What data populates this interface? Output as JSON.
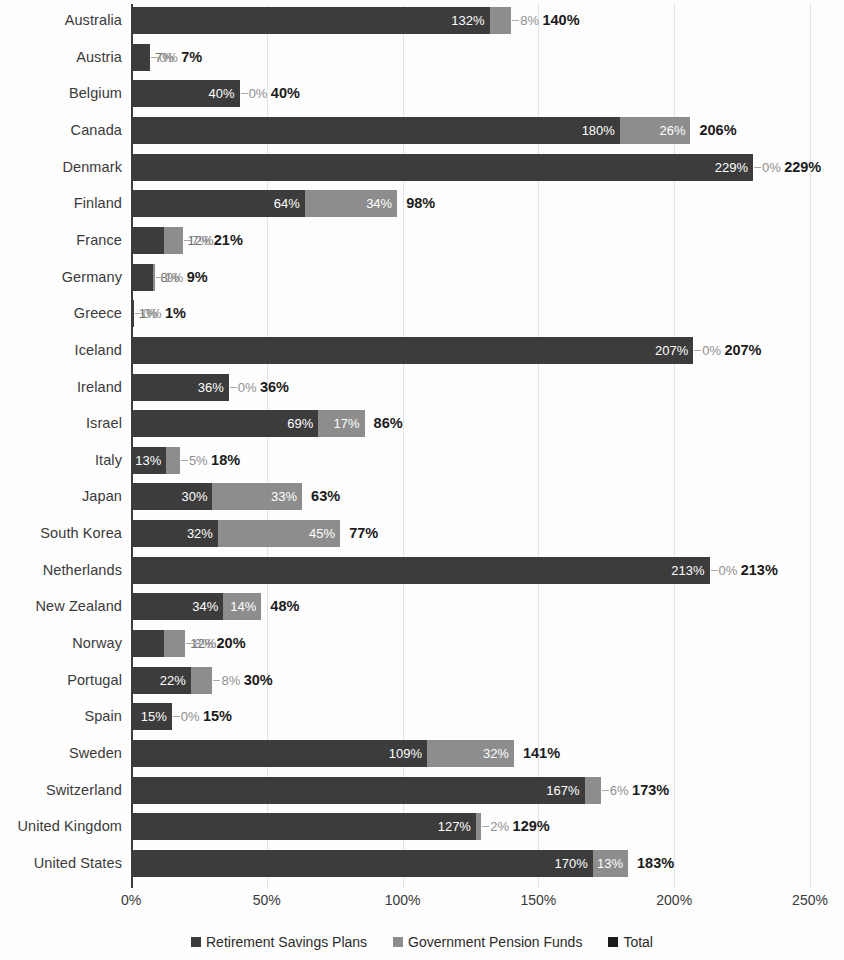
{
  "chart_data": {
    "type": "bar",
    "subtype": "stacked-horizontal",
    "title": "",
    "xlabel": "",
    "ylabel": "",
    "xlim": [
      0,
      250
    ],
    "xticks": [
      0,
      50,
      100,
      150,
      200,
      250
    ],
    "xtick_labels": [
      "0%",
      "50%",
      "100%",
      "150%",
      "200%",
      "250%"
    ],
    "grid": true,
    "grid_axis": "x",
    "legend_position": "bottom",
    "categories": [
      "Australia",
      "Austria",
      "Belgium",
      "Canada",
      "Denmark",
      "Finland",
      "France",
      "Germany",
      "Greece",
      "Iceland",
      "Ireland",
      "Israel",
      "Italy",
      "Japan",
      "South Korea",
      "Netherlands",
      "New Zealand",
      "Norway",
      "Portugal",
      "Spain",
      "Sweden",
      "Switzerland",
      "United Kingdom",
      "United States"
    ],
    "series": [
      {
        "name": "Retirement Savings Plans",
        "color": "#3c3c3c",
        "values": [
          132,
          7,
          40,
          180,
          229,
          64,
          12,
          8,
          1,
          207,
          36,
          69,
          13,
          30,
          32,
          213,
          34,
          12,
          22,
          15,
          109,
          167,
          127,
          170
        ]
      },
      {
        "name": "Government Pension Funds",
        "color": "#8d8d8d",
        "values": [
          8,
          0,
          0,
          26,
          0,
          34,
          7,
          1,
          0,
          0,
          0,
          17,
          5,
          33,
          45,
          0,
          14,
          8,
          8,
          0,
          32,
          6,
          2,
          13
        ]
      }
    ],
    "totals": {
      "name": "Total",
      "color": "#1b1b1b",
      "values": [
        140,
        7,
        40,
        206,
        229,
        98,
        21,
        9,
        1,
        207,
        36,
        86,
        18,
        63,
        77,
        213,
        48,
        20,
        30,
        15,
        141,
        173,
        129,
        183
      ]
    },
    "rows": [
      {
        "country": "Australia",
        "a": 132,
        "b": 8,
        "total": 140,
        "a_label": "132%",
        "b_label": "8%",
        "total_label": "140%"
      },
      {
        "country": "Austria",
        "a": 7,
        "b": 0,
        "total": 7,
        "a_label": "7%",
        "b_label": "0%",
        "total_label": "7%"
      },
      {
        "country": "Belgium",
        "a": 40,
        "b": 0,
        "total": 40,
        "a_label": "40%",
        "b_label": "0%",
        "total_label": "40%"
      },
      {
        "country": "Canada",
        "a": 180,
        "b": 26,
        "total": 206,
        "a_label": "180%",
        "b_label": "26%",
        "total_label": "206%"
      },
      {
        "country": "Denmark",
        "a": 229,
        "b": 0,
        "total": 229,
        "a_label": "229%",
        "b_label": "0%",
        "total_label": "229%"
      },
      {
        "country": "Finland",
        "a": 64,
        "b": 34,
        "total": 98,
        "a_label": "64%",
        "b_label": "34%",
        "total_label": "98%"
      },
      {
        "country": "France",
        "a": 12,
        "b": 7,
        "total": 21,
        "a_label": "12%",
        "b_label": "7%",
        "total_label": "21%"
      },
      {
        "country": "Germany",
        "a": 8,
        "b": 1,
        "total": 9,
        "a_label": "8%",
        "b_label": "1%",
        "total_label": "9%"
      },
      {
        "country": "Greece",
        "a": 1,
        "b": 0,
        "total": 1,
        "a_label": "1%",
        "b_label": "0%",
        "total_label": "1%"
      },
      {
        "country": "Iceland",
        "a": 207,
        "b": 0,
        "total": 207,
        "a_label": "207%",
        "b_label": "0%",
        "total_label": "207%"
      },
      {
        "country": "Ireland",
        "a": 36,
        "b": 0,
        "total": 36,
        "a_label": "36%",
        "b_label": "0%",
        "total_label": "36%"
      },
      {
        "country": "Israel",
        "a": 69,
        "b": 17,
        "total": 86,
        "a_label": "69%",
        "b_label": "17%",
        "total_label": "86%"
      },
      {
        "country": "Italy",
        "a": 13,
        "b": 5,
        "total": 18,
        "a_label": "13%",
        "b_label": "5%",
        "total_label": "18%"
      },
      {
        "country": "Japan",
        "a": 30,
        "b": 33,
        "total": 63,
        "a_label": "30%",
        "b_label": "33%",
        "total_label": "63%"
      },
      {
        "country": "South Korea",
        "a": 32,
        "b": 45,
        "total": 77,
        "a_label": "32%",
        "b_label": "45%",
        "total_label": "77%"
      },
      {
        "country": "Netherlands",
        "a": 213,
        "b": 0,
        "total": 213,
        "a_label": "213%",
        "b_label": "0%",
        "total_label": "213%"
      },
      {
        "country": "New Zealand",
        "a": 34,
        "b": 14,
        "total": 48,
        "a_label": "34%",
        "b_label": "14%",
        "total_label": "48%"
      },
      {
        "country": "Norway",
        "a": 12,
        "b": 8,
        "total": 20,
        "a_label": "12%",
        "b_label": "8%",
        "total_label": "20%"
      },
      {
        "country": "Portugal",
        "a": 22,
        "b": 8,
        "total": 30,
        "a_label": "22%",
        "b_label": "8%",
        "total_label": "30%"
      },
      {
        "country": "Spain",
        "a": 15,
        "b": 0,
        "total": 15,
        "a_label": "15%",
        "b_label": "0%",
        "total_label": "15%"
      },
      {
        "country": "Sweden",
        "a": 109,
        "b": 32,
        "total": 141,
        "a_label": "109%",
        "b_label": "32%",
        "total_label": "141%"
      },
      {
        "country": "Switzerland",
        "a": 167,
        "b": 6,
        "total": 173,
        "a_label": "167%",
        "b_label": "6%",
        "total_label": "173%"
      },
      {
        "country": "United Kingdom",
        "a": 127,
        "b": 2,
        "total": 129,
        "a_label": "127%",
        "b_label": "2%",
        "total_label": "129%"
      },
      {
        "country": "United States",
        "a": 170,
        "b": 13,
        "total": 183,
        "a_label": "170%",
        "b_label": "13%",
        "total_label": "183%"
      }
    ]
  },
  "legend": {
    "items": [
      {
        "label": "Retirement Savings Plans",
        "color": "#3c3c3c"
      },
      {
        "label": "Government Pension Funds",
        "color": "#8d8d8d"
      },
      {
        "label": "Total",
        "color": "#1b1b1b"
      }
    ]
  },
  "colors": {
    "series_a": "#3c3c3c",
    "series_b": "#8d8d8d",
    "total": "#1b1b1b",
    "gridline": "#e3e3e3",
    "axis": "#3d3d3d",
    "background": "#fdfdfd"
  }
}
